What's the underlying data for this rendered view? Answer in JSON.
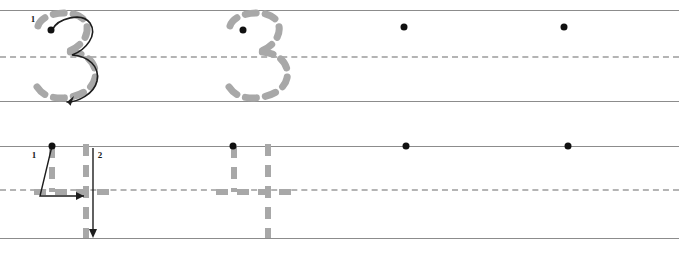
{
  "worksheet": {
    "title": "Number tracing practice worksheet",
    "width": 679,
    "height": 256,
    "colors": {
      "solid_rule": "#8c8c8c",
      "dashed_rule": "#b4b4b4",
      "trace_glyph": "#a8a8a8",
      "stroke_arrow": "#1a1a1a",
      "start_dot": "#111111",
      "page_background": "#ffffff"
    }
  },
  "rows": [
    {
      "id": "row-three",
      "character": "3",
      "label": "Row for tracing the digit three",
      "top_line_y": 10,
      "mid_line_y": 57,
      "bottom_line_y": 101,
      "models": [
        {
          "id": "three-model-guided",
          "type": "traced-glyph-with-arrow",
          "x": 30,
          "start_dot": {
            "x": 51,
            "y": 30
          },
          "stroke_labels": [
            {
              "text": "1",
              "x": 33,
              "y": 19
            }
          ]
        },
        {
          "id": "three-model-dashed",
          "type": "traced-glyph",
          "x": 222,
          "start_dot": {
            "x": 243,
            "y": 30
          },
          "stroke_labels": []
        }
      ],
      "practice_dots": [
        {
          "id": "three-practice-1",
          "x": 404,
          "y": 27
        },
        {
          "id": "three-practice-2",
          "x": 564,
          "y": 27
        }
      ]
    },
    {
      "id": "row-four",
      "character": "4",
      "label": "Row for tracing the digit four",
      "top_line_y": 146,
      "mid_line_y": 190,
      "bottom_line_y": 238,
      "models": [
        {
          "id": "four-model-guided",
          "type": "traced-glyph-with-arrow",
          "x": 30,
          "start_dot": {
            "x": 52,
            "y": 146
          },
          "stroke_labels": [
            {
              "text": "1",
              "x": 34,
              "y": 155
            },
            {
              "text": "2",
              "x": 100,
              "y": 155
            }
          ]
        },
        {
          "id": "four-model-dashed",
          "type": "traced-glyph",
          "x": 212,
          "start_dot": {
            "x": 233,
            "y": 146
          },
          "stroke_labels": []
        }
      ],
      "practice_dots": [
        {
          "id": "four-practice-1",
          "x": 406,
          "y": 146
        },
        {
          "id": "four-practice-2",
          "x": 568,
          "y": 146
        }
      ]
    }
  ]
}
